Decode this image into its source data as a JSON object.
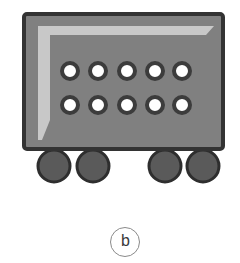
{
  "figure": {
    "label": "b",
    "colors": {
      "body_fill": "#808080",
      "body_border": "#333333",
      "highlight": "#cfcfcf",
      "dot_ring": "#3c3c3c",
      "dot_center": "#ffffff",
      "wheel_fill": "#5a5a5a",
      "wheel_border": "#2e2e2e",
      "label_circle": "#8a8a8a"
    },
    "dots": {
      "rows": 2,
      "columns": 5
    },
    "wheels": {
      "count": 4
    }
  }
}
